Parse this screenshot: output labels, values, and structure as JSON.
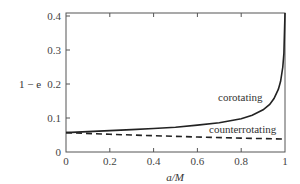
{
  "chart_data": {
    "type": "line",
    "title": "",
    "xlabel": "a/M",
    "ylabel": "1 − e",
    "xlim": [
      0,
      1
    ],
    "ylim": [
      0,
      0.42
    ],
    "xticks": [
      "0",
      "0.2",
      "0.4",
      "0.6",
      "0.8",
      "1"
    ],
    "yticks": [
      "0",
      "0.1",
      "0.2",
      "0.3",
      "0.4"
    ],
    "grid": false,
    "legend": "none (inline annotations)",
    "series": [
      {
        "name": "corotating",
        "style": "solid",
        "x": [
          0,
          0.1,
          0.2,
          0.3,
          0.4,
          0.5,
          0.6,
          0.7,
          0.8,
          0.85,
          0.9,
          0.93,
          0.95,
          0.97,
          0.98,
          0.99,
          0.995,
          1.0
        ],
        "y": [
          0.057,
          0.06,
          0.063,
          0.066,
          0.069,
          0.073,
          0.079,
          0.086,
          0.098,
          0.108,
          0.124,
          0.14,
          0.157,
          0.185,
          0.208,
          0.25,
          0.29,
          0.42
        ]
      },
      {
        "name": "counterrotating",
        "style": "dashed",
        "x": [
          0,
          0.2,
          0.4,
          0.6,
          0.8,
          1.0
        ],
        "y": [
          0.057,
          0.052,
          0.048,
          0.044,
          0.041,
          0.038
        ]
      }
    ],
    "annotations": [
      {
        "text": "corotating",
        "x": 0.84,
        "y": 0.15
      },
      {
        "text": "counterrotating",
        "x": 0.74,
        "y": 0.07
      }
    ]
  },
  "labels": {
    "xlabel": "a/M",
    "ylabel": "1 − e",
    "xticks": [
      "0",
      "0.2",
      "0.4",
      "0.6",
      "0.8",
      "1"
    ],
    "yticks": [
      "0",
      "0.1",
      "0.2",
      "0.3",
      "0.4"
    ],
    "corotating": "corotating",
    "counterrotating": "counterrotating"
  }
}
